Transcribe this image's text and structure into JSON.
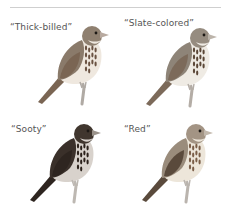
{
  "figure": {
    "panels": [
      {
        "label": "“Thick-billed”",
        "icon": "thick-billed-bird-illustration",
        "colors": {
          "back": "#8a7a6a",
          "wing": "#7a6553",
          "breast": "#efe8df",
          "streak": "#6a5242",
          "head": "#8f8070",
          "bill": "#b8aaa0",
          "leg": "#b0aaa4"
        }
      },
      {
        "label": "“Slate-colored”",
        "icon": "slate-colored-bird-illustration",
        "colors": {
          "back": "#8e8478",
          "wing": "#7c6a5a",
          "breast": "#efebe4",
          "streak": "#5a4636",
          "head": "#968c80",
          "bill": "#bcb4aa",
          "leg": "#b4ada6"
        }
      },
      {
        "label": "“Sooty”",
        "icon": "sooty-bird-illustration",
        "colors": {
          "back": "#3a302a",
          "wing": "#2e2520",
          "breast": "#d8d2cc",
          "streak": "#2a201a",
          "head": "#40362e",
          "bill": "#9a928a",
          "leg": "#bdb8b2"
        }
      },
      {
        "label": "“Red”",
        "icon": "red-bird-illustration",
        "colors": {
          "back": "#9a8c7c",
          "wing": "#5a4a3c",
          "breast": "#ede6da",
          "streak": "#7a5e48",
          "head": "#a39484",
          "bill": "#c2b8ac",
          "leg": "#bab4ae"
        }
      }
    ]
  }
}
